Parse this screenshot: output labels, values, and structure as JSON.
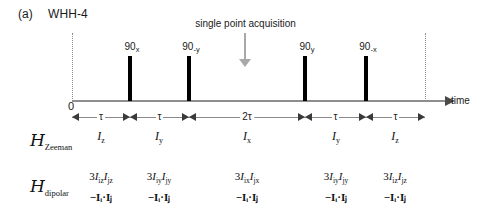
{
  "figure": {
    "panel_label": "(a)",
    "title": "WHH-4"
  },
  "annotation": {
    "acquisition_text": "single point acquisition",
    "arrow_icon": "down-arrow-icon",
    "arrow_color": "#a8a8a8"
  },
  "axis": {
    "time_label": "time",
    "origin_label": "0",
    "color": "#8e8e8e"
  },
  "pulses": [
    {
      "label_main": "90",
      "label_sub": "x",
      "x": 130
    },
    {
      "label_main": "90",
      "label_sub": "-y",
      "x": 189
    },
    {
      "label_main": "90",
      "label_sub": "y",
      "x": 305
    },
    {
      "label_main": "90",
      "label_sub": "-x",
      "x": 366
    }
  ],
  "intervals": [
    {
      "label": "τ",
      "start": 72,
      "end": 130
    },
    {
      "label": "τ",
      "start": 130,
      "end": 189
    },
    {
      "label": "2τ",
      "start": 189,
      "end": 305
    },
    {
      "label": "τ",
      "start": 305,
      "end": 366
    },
    {
      "label": "τ",
      "start": 366,
      "end": 425
    }
  ],
  "rows": {
    "zeeman": {
      "name_script": "H",
      "name_sub": "Zeeman",
      "cells": [
        {
          "main": "I",
          "sub": "z",
          "x": 101
        },
        {
          "main": "I",
          "sub": "y",
          "x": 159
        },
        {
          "main": "I",
          "sub": "x",
          "x": 247
        },
        {
          "main": "I",
          "sub": "y",
          "x": 336
        },
        {
          "main": "I",
          "sub": "z",
          "x": 395
        }
      ]
    },
    "dipolar": {
      "name_script": "H",
      "name_sub": "dipolar",
      "cells": [
        {
          "line1_prefix": "3",
          "line1_a": "I",
          "line1_a_sub": "iz",
          "line1_b": "I",
          "line1_b_sub": "jz",
          "line2": "−Iᵢ·Iⱼ",
          "x": 101
        },
        {
          "line1_prefix": "3",
          "line1_a": "I",
          "line1_a_sub": "iy",
          "line1_b": "I",
          "line1_b_sub": "jy",
          "line2": "−Iᵢ·Iⱼ",
          "x": 159
        },
        {
          "line1_prefix": "3",
          "line1_a": "I",
          "line1_a_sub": "ix",
          "line1_b": "I",
          "line1_b_sub": "jx",
          "line2": "−Iᵢ·Iⱼ",
          "x": 247
        },
        {
          "line1_prefix": "3",
          "line1_a": "I",
          "line1_a_sub": "iy",
          "line1_b": "I",
          "line1_b_sub": "jy",
          "line2": "−Iᵢ·Iⱼ",
          "x": 336
        },
        {
          "line1_prefix": "3",
          "line1_a": "I",
          "line1_a_sub": "iz",
          "line1_b": "I",
          "line1_b_sub": "jz",
          "line2": "−Iᵢ·Iⱼ",
          "x": 395
        }
      ]
    }
  },
  "boundaries": [
    72,
    425
  ]
}
